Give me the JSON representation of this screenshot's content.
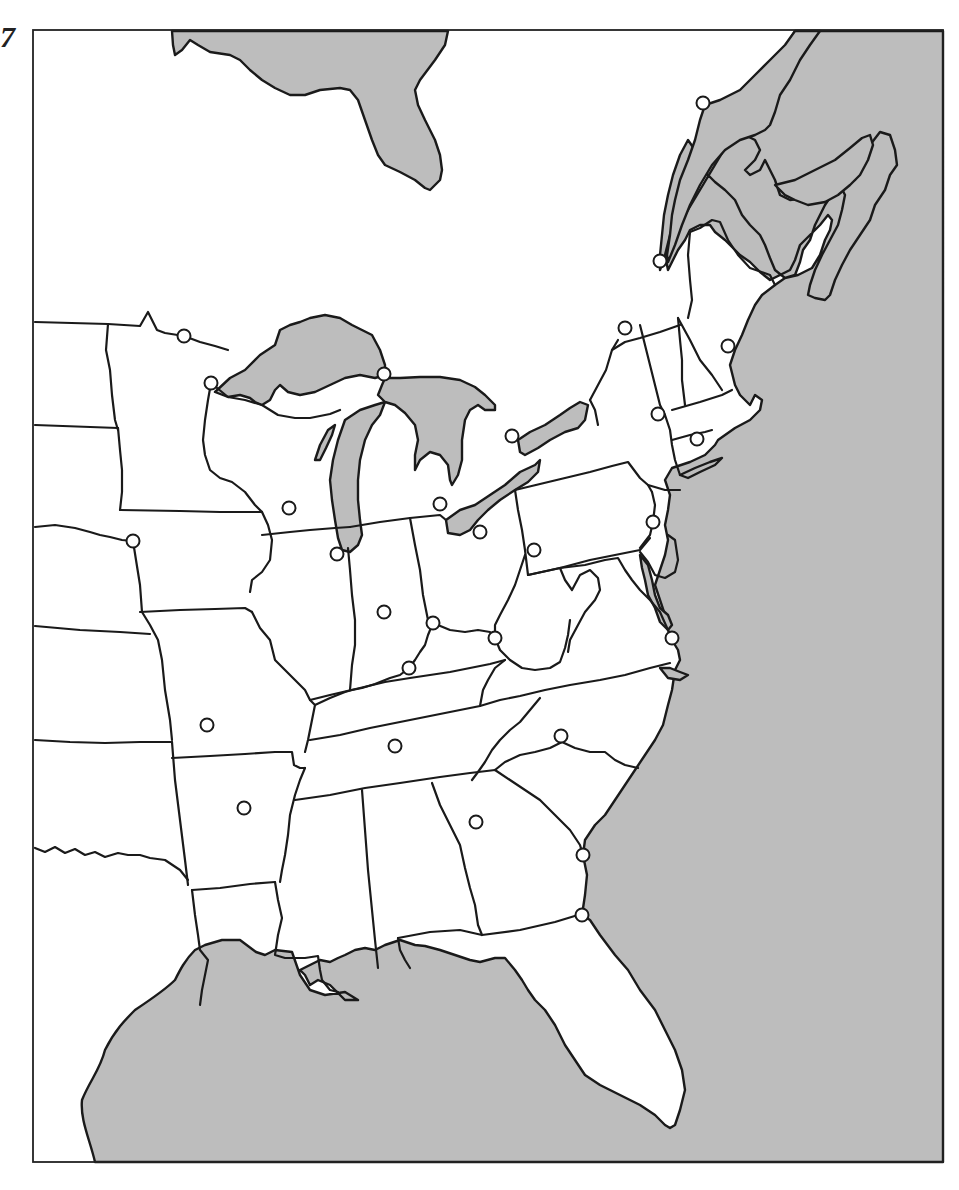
{
  "page": {
    "corner_mark": "7"
  },
  "map": {
    "type": "outline-map",
    "region": "Eastern United States",
    "frame": {
      "x": 33,
      "y": 30,
      "width": 910,
      "height": 1132
    },
    "colors": {
      "water": "#bdbdbd",
      "land": "#ffffff",
      "outline": "#1a1a1a"
    },
    "city_markers": [
      {
        "x": 703,
        "y": 103
      },
      {
        "x": 660,
        "y": 261
      },
      {
        "x": 625,
        "y": 328
      },
      {
        "x": 728,
        "y": 346
      },
      {
        "x": 184,
        "y": 336
      },
      {
        "x": 211,
        "y": 383
      },
      {
        "x": 384,
        "y": 374
      },
      {
        "x": 512,
        "y": 436
      },
      {
        "x": 658,
        "y": 414
      },
      {
        "x": 697,
        "y": 439
      },
      {
        "x": 289,
        "y": 508
      },
      {
        "x": 440,
        "y": 504
      },
      {
        "x": 480,
        "y": 532
      },
      {
        "x": 653,
        "y": 522
      },
      {
        "x": 133,
        "y": 541
      },
      {
        "x": 337,
        "y": 554
      },
      {
        "x": 534,
        "y": 550
      },
      {
        "x": 384,
        "y": 612
      },
      {
        "x": 433,
        "y": 623
      },
      {
        "x": 495,
        "y": 638
      },
      {
        "x": 672,
        "y": 638
      },
      {
        "x": 409,
        "y": 668
      },
      {
        "x": 207,
        "y": 725
      },
      {
        "x": 395,
        "y": 746
      },
      {
        "x": 561,
        "y": 736
      },
      {
        "x": 244,
        "y": 808
      },
      {
        "x": 476,
        "y": 822
      },
      {
        "x": 583,
        "y": 855
      },
      {
        "x": 582,
        "y": 915
      }
    ],
    "city_marker_radius": 6.5
  }
}
